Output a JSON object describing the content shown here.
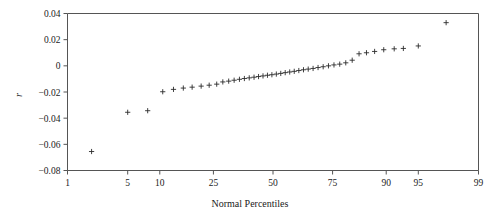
{
  "chart": {
    "type": "scatter",
    "title": "",
    "xlabel": "Normal Percentiles",
    "ylabel": "r",
    "marker_symbol": "plus",
    "background_color": "#ffffff",
    "axis_color": "#555555",
    "marker_color": "#2b2b2b",
    "grid": false,
    "legend": false
  },
  "chart_data": {
    "type": "scatter",
    "title": "",
    "xlabel": "Normal Percentiles",
    "ylabel": "r",
    "x_scale": "normal-probability",
    "xlim": [
      1,
      99
    ],
    "ylim": [
      -0.08,
      0.04
    ],
    "xticks": [
      1,
      5,
      10,
      25,
      50,
      75,
      90,
      95,
      99
    ],
    "xticklabels": [
      "1",
      "5",
      "10",
      "25",
      "50",
      "75",
      "90",
      "95",
      "99"
    ],
    "yticks": [
      0.04,
      0.02,
      0,
      -0.02,
      -0.04,
      -0.06,
      -0.08
    ],
    "yticklabels": [
      "0.04",
      "0.02",
      "0",
      "-0.02",
      "-0.04",
      "-0.06",
      "-0.08"
    ],
    "grid": false,
    "legend": false,
    "series": [
      {
        "name": "r",
        "marker": "plus",
        "color": "#2b2b2b",
        "points": [
          {
            "percentile": 2.0,
            "r": -0.0655
          },
          {
            "percentile": 5.0,
            "r": -0.0355
          },
          {
            "percentile": 7.8,
            "r": -0.0343
          },
          {
            "percentile": 10.6,
            "r": -0.0198
          },
          {
            "percentile": 13.0,
            "r": -0.018
          },
          {
            "percentile": 15.5,
            "r": -0.017
          },
          {
            "percentile": 18.0,
            "r": -0.0163
          },
          {
            "percentile": 20.8,
            "r": -0.0155
          },
          {
            "percentile": 23.5,
            "r": -0.0148
          },
          {
            "percentile": 26.2,
            "r": -0.014
          },
          {
            "percentile": 28.5,
            "r": -0.0123
          },
          {
            "percentile": 30.8,
            "r": -0.0117
          },
          {
            "percentile": 33.0,
            "r": -0.011
          },
          {
            "percentile": 35.2,
            "r": -0.0103
          },
          {
            "percentile": 37.3,
            "r": -0.0097
          },
          {
            "percentile": 39.4,
            "r": -0.0092
          },
          {
            "percentile": 41.5,
            "r": -0.0087
          },
          {
            "percentile": 43.5,
            "r": -0.0082
          },
          {
            "percentile": 45.5,
            "r": -0.0077
          },
          {
            "percentile": 47.5,
            "r": -0.0072
          },
          {
            "percentile": 49.5,
            "r": -0.0068
          },
          {
            "percentile": 51.5,
            "r": -0.0063
          },
          {
            "percentile": 53.5,
            "r": -0.0058
          },
          {
            "percentile": 55.5,
            "r": -0.0052
          },
          {
            "percentile": 57.5,
            "r": -0.0047
          },
          {
            "percentile": 59.5,
            "r": -0.0042
          },
          {
            "percentile": 61.5,
            "r": -0.0036
          },
          {
            "percentile": 63.5,
            "r": -0.003
          },
          {
            "percentile": 65.5,
            "r": -0.0025
          },
          {
            "percentile": 67.5,
            "r": -0.002
          },
          {
            "percentile": 69.5,
            "r": -0.0013
          },
          {
            "percentile": 71.5,
            "r": -0.0007
          },
          {
            "percentile": 73.5,
            "r": 0.0
          },
          {
            "percentile": 75.5,
            "r": 0.0007
          },
          {
            "percentile": 77.5,
            "r": 0.0013
          },
          {
            "percentile": 79.5,
            "r": 0.0023
          },
          {
            "percentile": 81.5,
            "r": 0.0043
          },
          {
            "percentile": 83.5,
            "r": 0.0092
          },
          {
            "percentile": 85.5,
            "r": 0.01
          },
          {
            "percentile": 87.5,
            "r": 0.011
          },
          {
            "percentile": 89.5,
            "r": 0.0123
          },
          {
            "percentile": 91.5,
            "r": 0.013
          },
          {
            "percentile": 93.0,
            "r": 0.0133
          },
          {
            "percentile": 95.0,
            "r": 0.0152
          },
          {
            "percentile": 97.5,
            "r": 0.033
          }
        ]
      }
    ]
  }
}
